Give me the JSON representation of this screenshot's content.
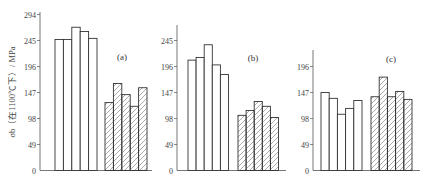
{
  "chart_data": {
    "type": "bar",
    "ylabel": "σb（在1100℃下）/ MPa",
    "legend": [],
    "series_styles": [
      {
        "name": "open",
        "fill": "none"
      },
      {
        "name": "hatched",
        "fill": "diagonal-hatch"
      }
    ],
    "panels": [
      {
        "label": "(a)",
        "yticks": [
          0,
          49,
          98,
          147,
          196,
          245,
          294
        ],
        "ylim": [
          0,
          294
        ],
        "series": [
          {
            "name": "open",
            "values": [
              247,
              247,
              270,
              262,
              249
            ]
          },
          {
            "name": "hatched",
            "values": [
              128,
              164,
              143,
              121,
              156
            ]
          }
        ]
      },
      {
        "label": "(b)",
        "yticks": [
          0,
          49,
          98,
          147,
          196,
          245
        ],
        "ylim": [
          0,
          275
        ],
        "series": [
          {
            "name": "open",
            "values": [
              208,
              213,
              237,
              199,
              181
            ]
          },
          {
            "name": "hatched",
            "values": [
              104,
              113,
              130,
              121,
              100
            ]
          }
        ]
      },
      {
        "label": "(c)",
        "yticks": [
          0,
          49,
          98,
          147,
          196
        ],
        "ylim": [
          0,
          226
        ],
        "series": [
          {
            "name": "open",
            "values": [
              147,
              136,
              106,
              117,
              132
            ]
          },
          {
            "name": "hatched",
            "values": [
              139,
              176,
              139,
              149,
              134
            ]
          }
        ]
      }
    ]
  }
}
